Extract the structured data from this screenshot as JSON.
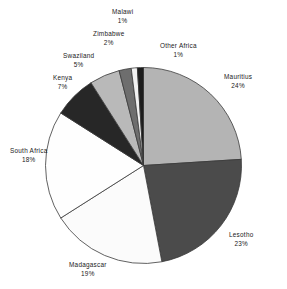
{
  "chart_data": {
    "type": "pie",
    "title": "",
    "subtitle": "",
    "xlabel": "",
    "ylabel": "",
    "legend_position": "none",
    "grid": false,
    "start_angle_deg": 0,
    "direction": "clockwise",
    "value_unit": "percent",
    "categories": [
      "Mauritius",
      "Lesotho",
      "Madagascar",
      "South Africa",
      "Kenya",
      "Swaziland",
      "Zimbabwe",
      "Malawi",
      "Other Africa"
    ],
    "values": [
      24,
      23,
      19,
      18,
      7,
      5,
      2,
      1,
      1
    ],
    "slices": [
      {
        "label": "Mauritius",
        "value": 24,
        "value_text": "24%",
        "color": "#b4b4b4",
        "label_position": "right",
        "label_x": 224,
        "label_y": 73
      },
      {
        "label": "Lesotho",
        "value": 23,
        "value_text": "23%",
        "color": "#4b4b4b",
        "label_position": "right",
        "label_x": 229,
        "label_y": 231
      },
      {
        "label": "Madagascar",
        "value": 19,
        "value_text": "19%",
        "color": "#fbfbfb",
        "label_position": "bottom",
        "label_x": 69,
        "label_y": 261
      },
      {
        "label": "South Africa",
        "value": 18,
        "value_text": "18%",
        "color": "#fefefe",
        "label_position": "left",
        "label_x": 10,
        "label_y": 147
      },
      {
        "label": "Kenya",
        "value": 7,
        "value_text": "7%",
        "color": "#272727",
        "label_position": "upper-left",
        "label_x": 53,
        "label_y": 74
      },
      {
        "label": "Swaziland",
        "value": 5,
        "value_text": "5%",
        "color": "#b9b9b9",
        "label_position": "upper-left",
        "label_x": 63,
        "label_y": 52
      },
      {
        "label": "Zimbabwe",
        "value": 2,
        "value_text": "2%",
        "color": "#6e6e6e",
        "label_position": "top",
        "label_x": 93,
        "label_y": 30
      },
      {
        "label": "Malawi",
        "value": 1,
        "value_text": "1%",
        "color": "#f2f2f2",
        "label_position": "top",
        "label_x": 112,
        "label_y": 8
      },
      {
        "label": "Other  Africa",
        "value": 1,
        "value_text": "1%",
        "color": "#1c1c1c",
        "label_position": "top-right",
        "label_x": 160,
        "label_y": 42
      }
    ]
  }
}
